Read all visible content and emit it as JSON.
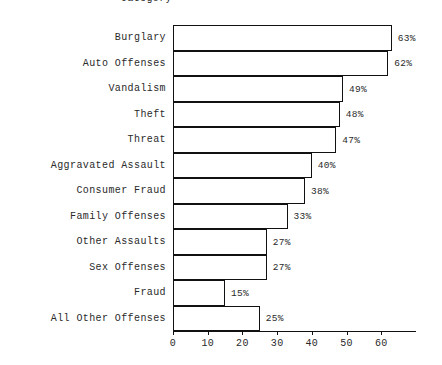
{
  "chart_data": {
    "type": "bar",
    "orientation": "horizontal",
    "title": "Category",
    "xlabel": "",
    "ylabel": "Category",
    "xlim": [
      0,
      70
    ],
    "grid": false,
    "legend": false,
    "value_suffix": "%",
    "xticks": [
      0,
      10,
      20,
      30,
      40,
      50,
      60
    ],
    "xtick_labels": [
      "0",
      "10",
      "20",
      "30",
      "40",
      "50",
      "60"
    ],
    "categories": [
      "Burglary",
      "Auto Offenses",
      "Vandalism",
      "Theft",
      "Threat",
      "Aggravated Assault",
      "Consumer Fraud",
      "Family Offenses",
      "Other Assaults",
      "Sex Offenses",
      "Fraud",
      "All Other Offenses"
    ],
    "values": [
      63,
      62,
      49,
      48,
      47,
      40,
      38,
      33,
      27,
      27,
      15,
      25
    ],
    "value_labels": [
      "63%",
      "62%",
      "49%",
      "48%",
      "47%",
      "40%",
      "38%",
      "33%",
      "27%",
      "27%",
      "15%",
      "25%"
    ],
    "bar_fill_color": "#ffffff",
    "bar_edge_color": "#111111",
    "text_color": "#2a2a2a",
    "background_color": "#ffffff"
  }
}
